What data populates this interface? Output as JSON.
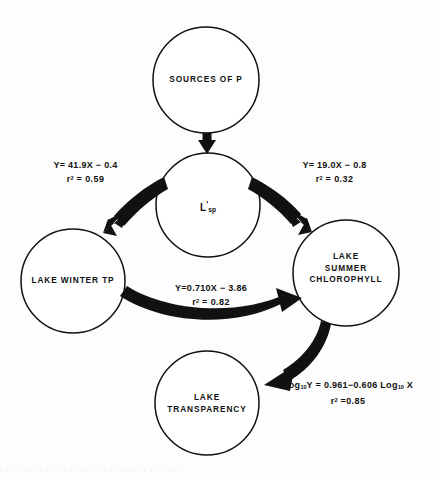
{
  "figure": {
    "type": "path-diagram",
    "background_color": "#fdfdfd",
    "stroke_color": "#111111",
    "nodes": [
      {
        "id": "sources-of-p",
        "label": "SOURCES OF P",
        "cx": 206,
        "cy": 80,
        "r": 53
      },
      {
        "id": "lsp",
        "label": "L'sp",
        "cx": 208,
        "cy": 205,
        "r": 52
      },
      {
        "id": "lake-winter-tp",
        "label": "LAKE WINTER TP",
        "cx": 73,
        "cy": 281,
        "r": 52
      },
      {
        "id": "lake-summer-chlorophyll",
        "label": "LAKE\nSUMMER\nCHLOROPHYLL",
        "cx": 346,
        "cy": 273,
        "r": 53
      },
      {
        "id": "lake-transparency",
        "label": "LAKE\nTRANSPARENCY",
        "cx": 207,
        "cy": 403,
        "r": 52
      }
    ],
    "edges": [
      {
        "id": "sources-to-lsp",
        "from": "sources-of-p",
        "to": "lsp",
        "equation": "",
        "r_squared": ""
      },
      {
        "id": "lsp-to-winter-tp",
        "from": "lsp",
        "to": "lake-winter-tp",
        "equation": "Y= 41.9X − 0.4",
        "r_squared": "0.59",
        "r_squared_text": "r² = 0.59"
      },
      {
        "id": "lsp-to-summer-chlorophyll",
        "from": "lsp",
        "to": "lake-summer-chlorophyll",
        "equation": "Y= 19.0X − 0.8",
        "r_squared": "0.32",
        "r_squared_text": "r² = 0.32"
      },
      {
        "id": "winter-tp-to-summer-chlorophyll",
        "from": "lake-winter-tp",
        "to": "lake-summer-chlorophyll",
        "equation": "Y=0.710X − 3.86",
        "r_squared": "0.82",
        "r_squared_text": "r² = 0.82"
      },
      {
        "id": "summer-chlorophyll-to-transparency",
        "from": "lake-summer-chlorophyll",
        "to": "lake-transparency",
        "equation": "Log₁₀Y = 0.961−0.606 Log₁₀ X",
        "r_squared": "0.85",
        "r_squared_text": "r² =0.85"
      }
    ]
  },
  "labels": {
    "node_sources_of_p": "SOURCES OF P",
    "node_lsp_base": "L",
    "node_lsp_prime": "'",
    "node_lsp_sub": "sp",
    "node_lake_winter_tp": "LAKE WINTER TP",
    "node_lake_summer_chlorophyll_l1": "LAKE",
    "node_lake_summer_chlorophyll_l2": "SUMMER",
    "node_lake_summer_chlorophyll_l3": "CHLOROPHYLL",
    "node_lake_transparency_l1": "LAKE",
    "node_lake_transparency_l2": "TRANSPARENCY",
    "eq_left_line1": "Y= 41.9X − 0.4",
    "eq_left_r": "r",
    "eq_left_r_exp": "2",
    "eq_left_r_val": " = 0.59",
    "eq_right_line1": "Y= 19.0X − 0.8",
    "eq_right_r": "r",
    "eq_right_r_exp": "2",
    "eq_right_r_val": " = 0.32",
    "eq_mid_line1": "Y=0.710X − 3.86",
    "eq_mid_r": "r",
    "eq_mid_r_exp": "2",
    "eq_mid_r_val": " = 0.82",
    "eq_bottom_log1": "Log",
    "eq_bottom_sub1": "10",
    "eq_bottom_mid": "Y = 0.961−0.606 Log",
    "eq_bottom_sub2": "10",
    "eq_bottom_end": " X",
    "eq_bottom_r": "r",
    "eq_bottom_r_exp": "2",
    "eq_bottom_r_val": " =0.85"
  },
  "caption_remnant": "................................"
}
